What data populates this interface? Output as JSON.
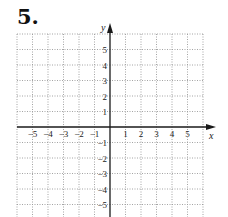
{
  "problem": {
    "number": "5."
  },
  "chart_data": {
    "type": "scatter",
    "title": "",
    "xlabel": "x",
    "ylabel": "y",
    "xlim": [
      -6,
      6
    ],
    "ylim": [
      -6,
      6
    ],
    "grid": true,
    "grid_style": "dotted",
    "x_ticks": [
      -5,
      -4,
      -3,
      -2,
      -1,
      1,
      2,
      3,
      4,
      5
    ],
    "y_ticks": [
      5,
      4,
      3,
      2,
      1,
      -1,
      -2,
      -3,
      -4,
      -5
    ],
    "x_tick_labels": [
      "−5",
      "−4",
      "−3",
      "−2",
      "−1",
      "1",
      "2",
      "3",
      "4",
      "5"
    ],
    "y_tick_labels": [
      "5",
      "4",
      "3",
      "2",
      "1",
      "−1",
      "−2",
      "−3",
      "−4",
      "−5"
    ],
    "series": [],
    "colors": {
      "grid": "#9a9a9a",
      "axis": "#1a1a1a"
    }
  }
}
